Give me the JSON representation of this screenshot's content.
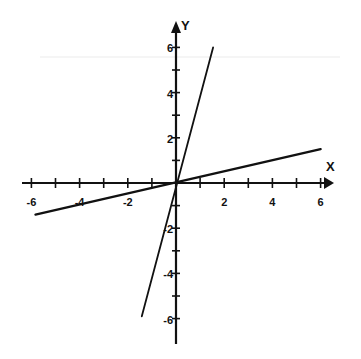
{
  "chart_data": {
    "type": "line",
    "title": "",
    "xlabel": "X",
    "ylabel": "Y",
    "xlim": [
      -6,
      6
    ],
    "ylim": [
      -7,
      6.5
    ],
    "grid": false,
    "legend": null,
    "x_ticks": [
      -6,
      -5,
      -4,
      -3,
      -2,
      -1,
      1,
      2,
      3,
      4,
      5,
      6
    ],
    "x_tick_labels": [
      "-6",
      "-4",
      "-2",
      "2",
      "4",
      "6"
    ],
    "x_tick_label_values": [
      -6,
      -4,
      -2,
      2,
      4,
      6
    ],
    "y_ticks": [
      -6,
      -5,
      -4,
      -3,
      -2,
      -1,
      1,
      2,
      3,
      4,
      5,
      6
    ],
    "y_tick_labels": [
      "6",
      "4",
      "2",
      "-2",
      "-4",
      "-6"
    ],
    "y_tick_label_values": [
      6,
      4,
      2,
      -2,
      -4,
      -6
    ],
    "series": [
      {
        "name": "steep line (y = 4x)",
        "x": [
          -1.42,
          1.54
        ],
        "y": [
          -5.9,
          6.0
        ]
      },
      {
        "name": "shallow line (y = x/4)",
        "x": [
          -5.83,
          6.0
        ],
        "y": [
          -1.4,
          1.5
        ]
      }
    ],
    "line_color": "#111111"
  },
  "axes": {
    "x_title": "X",
    "y_title": "Y"
  }
}
